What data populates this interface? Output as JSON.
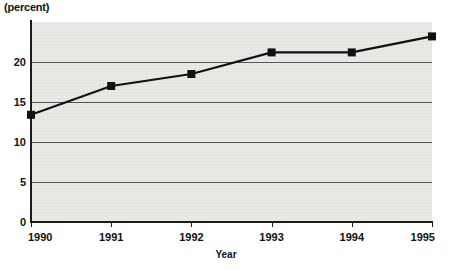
{
  "chart_data": {
    "type": "line",
    "title": "",
    "ylabel": "(percent)",
    "xlabel": "Year",
    "categories": [
      "1990",
      "1991",
      "1992",
      "1993",
      "1994",
      "1995"
    ],
    "x": [
      1990,
      1991,
      1992,
      1993,
      1994,
      1995
    ],
    "values": [
      13.4,
      17.0,
      18.5,
      21.2,
      21.2,
      23.2
    ],
    "series": [
      {
        "name": "percent",
        "values": [
          13.4,
          17.0,
          18.5,
          21.2,
          21.2,
          23.2
        ]
      }
    ],
    "ylim": [
      0,
      25
    ],
    "xlim": [
      1990,
      1995
    ],
    "yticks": [
      0,
      5,
      10,
      15,
      20
    ],
    "ytick_labels": [
      "0",
      "5",
      "10",
      "15",
      "20"
    ],
    "xtick_labels": [
      "1990",
      "1991",
      "1992",
      "1993",
      "1994",
      "1995"
    ],
    "grid": "horizontal",
    "legend": "none",
    "marker": "square",
    "line_color": "#111111",
    "marker_color": "#111111",
    "plot_background": "#e9e9e6",
    "grid_color": "#55565a",
    "axis_color": "#1a1a1a"
  },
  "axes": {
    "y_unit_caption": "(percent)",
    "x_title": "Year"
  }
}
